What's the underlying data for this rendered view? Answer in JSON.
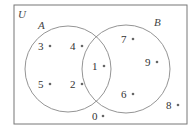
{
  "diagram": {
    "type": "venn",
    "universe_label": "U",
    "sets": [
      {
        "name": "A",
        "label": "A"
      },
      {
        "name": "B",
        "label": "B"
      }
    ],
    "elements": {
      "only_A": [
        "3",
        "4",
        "5",
        "2"
      ],
      "A_and_B": [
        "1"
      ],
      "only_B": [
        "7",
        "9",
        "6"
      ],
      "outside": [
        "8",
        "0"
      ]
    },
    "points": [
      {
        "value": "3",
        "region": "A only"
      },
      {
        "value": "4",
        "region": "A only"
      },
      {
        "value": "5",
        "region": "A only"
      },
      {
        "value": "2",
        "region": "A only"
      },
      {
        "value": "1",
        "region": "A and B"
      },
      {
        "value": "7",
        "region": "B only"
      },
      {
        "value": "9",
        "region": "B only"
      },
      {
        "value": "6",
        "region": "B only"
      },
      {
        "value": "8",
        "region": "outside"
      },
      {
        "value": "0",
        "region": "outside"
      }
    ],
    "colors": {
      "stroke": "#777777",
      "text": "#333333",
      "dot": "#666666"
    }
  }
}
